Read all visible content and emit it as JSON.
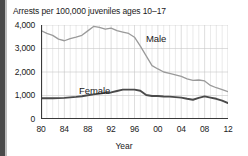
{
  "figure": {
    "title": "Arrests per 100,000 juveniles ages 10–17",
    "xaxis_title": "Year"
  },
  "chart_data": {
    "type": "line",
    "title": "Arrests per 100,000 juveniles ages 10–17",
    "xlabel": "Year",
    "ylabel": "",
    "xlim": [
      1980,
      2012
    ],
    "ylim": [
      0,
      4000
    ],
    "grid": true,
    "legend_position": "inline-annotations",
    "y_ticks": [
      0,
      1000,
      2000,
      3000,
      4000
    ],
    "y_tick_labels": [
      "0",
      "1,000",
      "2,000",
      "3,000",
      "4,000"
    ],
    "x_ticks": [
      1980,
      1984,
      1988,
      1992,
      1996,
      2000,
      2004,
      2008,
      2012
    ],
    "x_tick_labels": [
      "80",
      "84",
      "88",
      "92",
      "96",
      "00",
      "04",
      "08",
      "12"
    ],
    "x": [
      1980,
      1981,
      1982,
      1983,
      1984,
      1985,
      1986,
      1987,
      1988,
      1989,
      1990,
      1991,
      1992,
      1993,
      1994,
      1995,
      1996,
      1997,
      1998,
      1999,
      2000,
      2001,
      2002,
      2003,
      2004,
      2005,
      2006,
      2007,
      2008,
      2009,
      2010,
      2011,
      2012
    ],
    "series": [
      {
        "name": "Male",
        "color": "#9a9a9a",
        "label_text": "Male",
        "values": [
          3760,
          3640,
          3560,
          3400,
          3330,
          3420,
          3480,
          3560,
          3750,
          3940,
          3900,
          3820,
          3870,
          3760,
          3700,
          3640,
          3480,
          3100,
          2690,
          2270,
          2130,
          2000,
          1940,
          1880,
          1810,
          1710,
          1640,
          1660,
          1620,
          1430,
          1330,
          1250,
          1160
        ]
      },
      {
        "name": "Female",
        "color": "#4a4a4a",
        "label_text": "Female",
        "values": [
          880,
          880,
          880,
          890,
          900,
          920,
          940,
          970,
          1010,
          1050,
          1080,
          1110,
          1130,
          1190,
          1250,
          1250,
          1250,
          1200,
          1020,
          980,
          980,
          960,
          950,
          930,
          910,
          860,
          820,
          900,
          960,
          910,
          860,
          780,
          680
        ]
      }
    ]
  }
}
